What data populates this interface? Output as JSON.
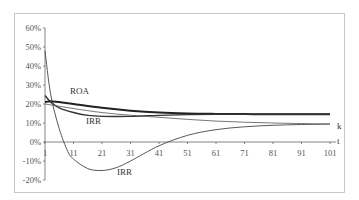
{
  "chart_data": {
    "type": "line",
    "title": "",
    "xlabel": "t",
    "ylabel": "",
    "x_ticks": [
      "1",
      "11",
      "21",
      "31",
      "41",
      "51",
      "61",
      "71",
      "81",
      "91",
      "101"
    ],
    "y_ticks": [
      "60%",
      "50%",
      "40%",
      "30%",
      "20%",
      "10%",
      "0%",
      "-10%",
      "-20%"
    ],
    "ylim": [
      -0.2,
      0.6
    ],
    "xlim": [
      1,
      101
    ],
    "grid": false,
    "legend": "none (inline labels)",
    "annotations": [
      "ROA",
      "IRR",
      "IRR",
      "k",
      "t"
    ],
    "series": [
      {
        "name": "ROA",
        "x": [
          1,
          3,
          6,
          11,
          21,
          31,
          41,
          51,
          61,
          71,
          81,
          91,
          101
        ],
        "values": [
          0.21,
          0.215,
          0.21,
          0.2,
          0.18,
          0.165,
          0.155,
          0.15,
          0.148,
          0.147,
          0.146,
          0.146,
          0.146
        ]
      },
      {
        "name": "IRR (upper)",
        "x": [
          1,
          3,
          6,
          11,
          16,
          21,
          31,
          41,
          51,
          61,
          71,
          81,
          91,
          101
        ],
        "values": [
          0.245,
          0.21,
          0.18,
          0.155,
          0.14,
          0.135,
          0.135,
          0.14,
          0.144,
          0.146,
          0.146,
          0.146,
          0.146,
          0.146
        ]
      },
      {
        "name": "IRR (lower)",
        "x": [
          1,
          3,
          6,
          9,
          11,
          16,
          21,
          26,
          31,
          41,
          51,
          61,
          71,
          81,
          91,
          101
        ],
        "values": [
          0.48,
          0.25,
          0.07,
          -0.05,
          -0.09,
          -0.14,
          -0.15,
          -0.135,
          -0.1,
          -0.02,
          0.035,
          0.065,
          0.08,
          0.088,
          0.092,
          0.094
        ]
      },
      {
        "name": "k",
        "x": [
          1,
          21,
          41,
          61,
          81,
          101
        ],
        "values": [
          0.2,
          0.155,
          0.13,
          0.11,
          0.1,
          0.095
        ]
      }
    ]
  },
  "labels": {
    "roa": "ROA",
    "irr_upper": "IRR",
    "irr_lower": "IRR",
    "k": "k",
    "t": "t"
  }
}
